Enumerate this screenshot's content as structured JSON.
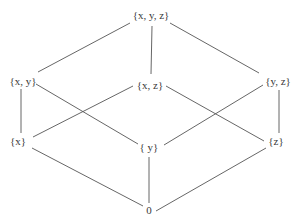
{
  "diagram": {
    "type": "hasse-diagram",
    "title": "",
    "nodes": [
      {
        "id": "xyz",
        "label": "{x, y, z}"
      },
      {
        "id": "xy",
        "label": "{x, y}"
      },
      {
        "id": "xz",
        "label": "{x, z}"
      },
      {
        "id": "yz",
        "label": "{y, z}"
      },
      {
        "id": "x",
        "label": "{x}"
      },
      {
        "id": "y",
        "label": "{ y}"
      },
      {
        "id": "z",
        "label": "{z}"
      },
      {
        "id": "empty",
        "label": "0"
      }
    ],
    "edges": [
      {
        "from": "xyz",
        "to": "xy"
      },
      {
        "from": "xyz",
        "to": "xz"
      },
      {
        "from": "xyz",
        "to": "yz"
      },
      {
        "from": "xy",
        "to": "x"
      },
      {
        "from": "xy",
        "to": "y"
      },
      {
        "from": "xz",
        "to": "x"
      },
      {
        "from": "xz",
        "to": "z"
      },
      {
        "from": "yz",
        "to": "y"
      },
      {
        "from": "yz",
        "to": "z"
      },
      {
        "from": "x",
        "to": "empty"
      },
      {
        "from": "y",
        "to": "empty"
      },
      {
        "from": "z",
        "to": "empty"
      }
    ],
    "colors": {
      "line": "#555555",
      "text": "#3a3a3a",
      "background": "#ffffff"
    }
  }
}
